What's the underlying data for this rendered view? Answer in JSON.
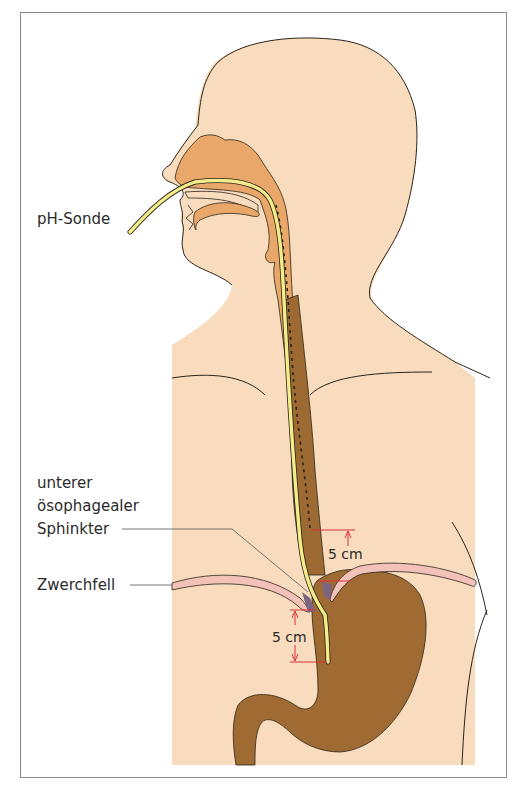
{
  "figure": {
    "type": "anatomical-diagram",
    "labels": {
      "probe": "pH-Sonde",
      "les_line1": "unterer",
      "les_line2": "ösophagealer",
      "les_line3": "Sphinkter",
      "diaphragm": "Zwerchfell"
    },
    "dimensions": {
      "upper": "5 cm",
      "lower": "5 cm"
    },
    "colors": {
      "skin": "#f8dcbd",
      "airway": "#e9a86a",
      "esophagus": "#9c6a32",
      "stomach": "#a06b33",
      "probe": "#f2ec8a",
      "diaphragm": "#f2c2b8",
      "dimension_lines": "#d9303a",
      "outline": "#2b2418",
      "frame": "#8a8a8a"
    }
  }
}
